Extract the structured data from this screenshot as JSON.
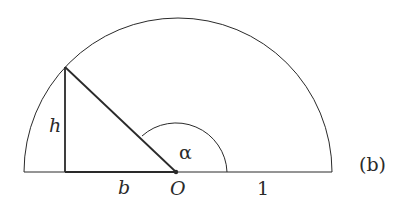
{
  "diagram": {
    "caption": "(b)",
    "labels": {
      "height": "h",
      "base": "b",
      "origin": "O",
      "radius": "1",
      "angle": "α"
    },
    "colors": {
      "stroke": "#2a2a2a",
      "background": "#ffffff"
    }
  }
}
